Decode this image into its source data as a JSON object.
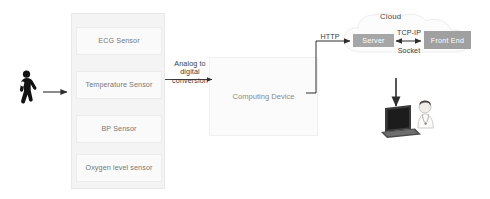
{
  "diagram": {
    "colors": {
      "server_box": "#a6a6a6",
      "frontend_box": "#a0a0a0",
      "sensor_panel": "#f4f4f4",
      "sensor_cell": "#fafafa",
      "computing_device": "#fbfbfb",
      "line": "#4a4a4a",
      "text": "#3c3c3c",
      "muted_text": "#8a8a8a"
    },
    "patient": {
      "icon": "walking-person-icon",
      "label": ""
    },
    "sensors": {
      "panel_name": "sensor-panel",
      "items": [
        {
          "label": "ECG Sensor"
        },
        {
          "label": "Temperature Sensor"
        },
        {
          "label": "BP Sensor"
        },
        {
          "label": "Oxygen level sensor"
        }
      ]
    },
    "computing_device": {
      "label": "Computing Device"
    },
    "cloud": {
      "label": "Cloud",
      "server": {
        "label": "Server"
      },
      "frontend": {
        "label": "Front End"
      }
    },
    "connectors": {
      "patient_to_sensors": {
        "label": "",
        "icon": "arrow-right-icon"
      },
      "sensors_to_device": {
        "label": "Analog to digital conversion",
        "icon": "arrow-right-icon"
      },
      "device_to_server": {
        "label": "HTTP",
        "icon": "arrow-right-icon"
      },
      "server_to_frontend": {
        "label_top": "TCP-IP",
        "label_bottom": "Socket",
        "icon": "arrow-bidirectional-icon"
      },
      "frontend_to_workstation": {
        "label": "",
        "icon": "arrow-down-icon"
      }
    },
    "workstation": {
      "laptop_icon": "laptop-icon",
      "person_icon": "doctor-icon"
    }
  }
}
